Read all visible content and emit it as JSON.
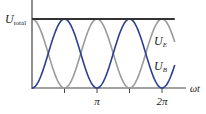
{
  "chart_data": {
    "type": "line",
    "title": "",
    "xlabel": "ωt",
    "ylabel": "",
    "xlim": [
      0,
      6.9
    ],
    "ylim": [
      0,
      1
    ],
    "grid": false,
    "x_ticks": [
      {
        "value": 1.5708,
        "label": ""
      },
      {
        "value": 3.1416,
        "label": "π"
      },
      {
        "value": 4.7124,
        "label": ""
      },
      {
        "value": 6.2832,
        "label": "2π"
      }
    ],
    "series": [
      {
        "name": "U_total",
        "label_main": "U",
        "label_sub": "total",
        "formula": "constant 1",
        "color": "#333333",
        "values_note": "U_total = 1 for all ωt"
      },
      {
        "name": "U_E",
        "label_main": "U",
        "label_sub": "E",
        "formula": "cos²(ωt)",
        "color": "#9a9a9a"
      },
      {
        "name": "U_B",
        "label_main": "U",
        "label_sub": "B",
        "formula": "sin²(ωt)",
        "color": "#2b3f91"
      }
    ],
    "x": [
      0,
      0.785,
      1.571,
      2.356,
      3.142,
      3.927,
      4.712,
      5.498,
      6.283,
      6.9
    ],
    "U_total_values": [
      1,
      1,
      1,
      1,
      1,
      1,
      1,
      1,
      1,
      1
    ],
    "U_E_values": [
      1,
      0.5,
      0,
      0.5,
      1,
      0.5,
      0,
      0.5,
      1,
      0.66
    ],
    "U_B_values": [
      0,
      0.5,
      1,
      0.5,
      0,
      0.5,
      1,
      0.5,
      0,
      0.34
    ]
  }
}
